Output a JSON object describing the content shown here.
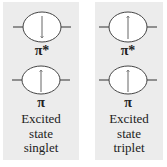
{
  "panels": [
    {
      "name": "singlet",
      "orbitals": [
        {
          "label": "π*",
          "electron_spin": "down"
        },
        {
          "label": "π",
          "electron_spin": "up"
        }
      ],
      "caption": [
        "Excited",
        "state",
        "singlet"
      ]
    },
    {
      "name": "triplet",
      "orbitals": [
        {
          "label": "π*",
          "electron_spin": "up"
        },
        {
          "label": "π",
          "electron_spin": "up"
        }
      ],
      "caption": [
        "Excited",
        "state",
        "triplet"
      ]
    }
  ],
  "colors": {
    "panel_background": "#ececec",
    "line": "#333333"
  }
}
